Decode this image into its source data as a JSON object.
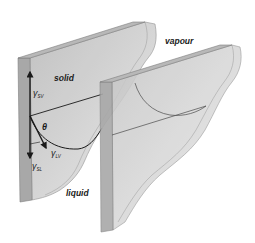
{
  "figure": {
    "labels": {
      "solid": "solid",
      "vapour": "vapour",
      "liquid": "liquid",
      "theta": "θ"
    },
    "vectors": [
      {
        "symbol": "γ",
        "subscript": "SV",
        "direction": "up"
      },
      {
        "symbol": "γ",
        "subscript": "SL",
        "direction": "down"
      },
      {
        "symbol": "γ",
        "subscript": "LV",
        "direction": "along meniscus tangent"
      }
    ],
    "colors": {
      "plate_fill": "#c9c9c9",
      "plate_edge": "#8a8a8a",
      "plate_side": "#a9a9a9",
      "line": "#1a1a1a",
      "background": "#ffffff"
    }
  }
}
